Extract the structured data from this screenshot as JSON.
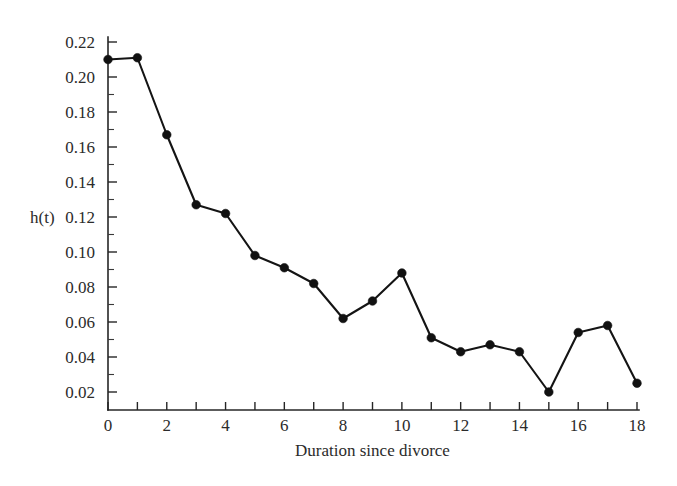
{
  "chart_data": {
    "type": "line",
    "title": "",
    "subtitle": "",
    "xlabel": "Duration since divorce",
    "ylabel": "h(t)",
    "xlim": [
      0,
      18
    ],
    "ylim": [
      0.0,
      0.22
    ],
    "grid": false,
    "legend": null,
    "marker": "filled-circle",
    "x": [
      0,
      1,
      2,
      3,
      4,
      5,
      6,
      7,
      8,
      9,
      10,
      11,
      12,
      13,
      14,
      15,
      16,
      17,
      18
    ],
    "values": [
      0.21,
      0.211,
      0.167,
      0.127,
      0.122,
      0.098,
      0.091,
      0.082,
      0.062,
      0.072,
      0.088,
      0.051,
      0.043,
      0.047,
      0.043,
      0.02,
      0.054,
      0.058,
      0.025
    ],
    "series": [
      {
        "name": "h(t)",
        "values": [
          0.21,
          0.211,
          0.167,
          0.127,
          0.122,
          0.098,
          0.091,
          0.082,
          0.062,
          0.072,
          0.088,
          0.051,
          0.043,
          0.047,
          0.043,
          0.02,
          0.054,
          0.058,
          0.025
        ]
      }
    ],
    "x_ticks": [
      0,
      1,
      2,
      3,
      4,
      5,
      6,
      7,
      8,
      9,
      10,
      11,
      12,
      13,
      14,
      15,
      16,
      17,
      18
    ],
    "x_tick_labels": [
      "0",
      "",
      "2",
      "",
      "4",
      "",
      "6",
      "",
      "8",
      "",
      "10",
      "",
      "12",
      "",
      "14",
      "",
      "16",
      "",
      "18"
    ],
    "y_ticks": [
      0.02,
      0.04,
      0.06,
      0.08,
      0.1,
      0.12,
      0.14,
      0.16,
      0.18,
      0.2,
      0.22
    ],
    "y_tick_labels": [
      "0.02",
      "0.04",
      "0.06",
      "0.08",
      "0.10",
      "0.12",
      "0.14",
      "0.16",
      "0.18",
      "0.20",
      "0.22"
    ],
    "y_minor_ticks": [
      0.03,
      0.05,
      0.07,
      0.09,
      0.11,
      0.13,
      0.15,
      0.17,
      0.19,
      0.21
    ],
    "colors": {
      "line": "#141414",
      "marker": "#111111",
      "axis": "#262626",
      "text": "#2b2b2b",
      "background": "#ffffff"
    }
  }
}
